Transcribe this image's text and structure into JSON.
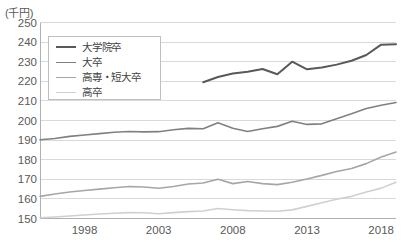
{
  "chart_data": {
    "type": "line",
    "title": "",
    "subtitle": "",
    "unit_label": "(千円)",
    "xlabel": "",
    "ylabel": "",
    "ylim": [
      150,
      250
    ],
    "ytick_step": 10,
    "yticks": [
      250,
      240,
      230,
      220,
      210,
      200,
      190,
      180,
      170,
      160,
      150
    ],
    "xlim": [
      1995,
      2019
    ],
    "xticks": [
      1998,
      2003,
      2008,
      2013,
      2018
    ],
    "xtick_labels": [
      "1998",
      "2003",
      "2008",
      "2013",
      "2018"
    ],
    "grid": "horizontal",
    "legend_position": "upper-left-inside",
    "x": [
      1995,
      1996,
      1997,
      1998,
      1999,
      2000,
      2001,
      2002,
      2003,
      2004,
      2005,
      2006,
      2007,
      2008,
      2009,
      2010,
      2011,
      2012,
      2013,
      2014,
      2015,
      2016,
      2017,
      2018,
      2019
    ],
    "series": [
      {
        "name": "大学院卒",
        "color": "#595959",
        "width": 2.0,
        "values": [
          null,
          null,
          null,
          null,
          null,
          null,
          null,
          null,
          null,
          null,
          null,
          219.5,
          222.2,
          224.0,
          224.9,
          226.3,
          223.6,
          230.0,
          226.1,
          227.0,
          228.5,
          230.5,
          233.4,
          238.7,
          238.9
        ]
      },
      {
        "name": "大卒",
        "color": "#808080",
        "width": 1.6,
        "values": [
          190.2,
          190.8,
          191.9,
          192.6,
          193.3,
          194.0,
          194.4,
          194.2,
          194.3,
          195.3,
          196.0,
          195.8,
          198.8,
          196.0,
          194.4,
          195.8,
          197.0,
          199.6,
          198.0,
          198.3,
          200.9,
          203.4,
          206.1,
          207.8,
          209.2
        ]
      },
      {
        "name": "高専・短大卒",
        "color": "#a6a6a6",
        "width": 1.6,
        "values": [
          161.3,
          162.5,
          163.5,
          164.3,
          165.0,
          165.7,
          166.3,
          166.1,
          165.4,
          166.3,
          167.6,
          168.1,
          170.0,
          167.8,
          168.9,
          167.8,
          167.3,
          168.5,
          170.2,
          172.0,
          174.0,
          175.5,
          178.0,
          181.4,
          183.9
        ]
      },
      {
        "name": "高卒",
        "color": "#d0d0d0",
        "width": 1.6,
        "values": [
          150.4,
          150.8,
          151.3,
          151.8,
          152.3,
          152.7,
          153.0,
          152.9,
          152.4,
          153.0,
          153.5,
          153.8,
          155.1,
          154.5,
          154.0,
          153.8,
          153.7,
          154.4,
          156.2,
          158.0,
          159.8,
          161.3,
          163.5,
          165.5,
          168.5
        ]
      }
    ],
    "legend": [
      {
        "label": "大学院卒",
        "color": "#595959",
        "width": 2.2
      },
      {
        "label": "大卒",
        "color": "#808080",
        "width": 1.8
      },
      {
        "label": "高専・短大卒",
        "color": "#a6a6a6",
        "width": 1.8
      },
      {
        "label": "高卒",
        "color": "#d0d0d0",
        "width": 1.8
      }
    ],
    "colors": {
      "grid": "#d9d9d9",
      "axis": "#b0b0b0",
      "text": "#595959",
      "background": "#ffffff"
    }
  }
}
